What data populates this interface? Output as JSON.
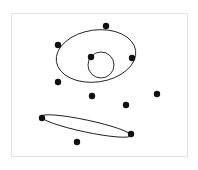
{
  "figure": {
    "title": "",
    "caption": "",
    "background_color": "#ffffff",
    "frame": {
      "name": "figure-border",
      "x": 11,
      "y": 13,
      "width": 177,
      "height": 144,
      "stroke_color": "#e3e3e3",
      "stroke_width": 1
    },
    "stroke_color": "#1a1a1a",
    "point_color": "#111111"
  },
  "chart_data": {
    "type": "scatter",
    "title": "",
    "xlabel": "",
    "ylabel": "",
    "xlim": [
      11,
      188
    ],
    "ylim": [
      13,
      157
    ],
    "grid": false,
    "legend": "none",
    "annotations": [
      "two fitted ellipses over a scattered point set",
      "small circle nested within the upper large ellipse"
    ],
    "ellipses": [
      {
        "name": "large-ellipse",
        "cx": 96,
        "cy": 56,
        "rx": 40,
        "ry": 26,
        "rotation_deg": -8,
        "stroke_color": "#1a1a1a",
        "stroke_width": 0.9
      },
      {
        "name": "small-circle",
        "cx": 101,
        "cy": 65,
        "rx": 13,
        "ry": 13,
        "rotation_deg": 0,
        "stroke_color": "#1a1a1a",
        "stroke_width": 0.9
      },
      {
        "name": "flat-ellipse",
        "cx": 86,
        "cy": 126,
        "rx": 46,
        "ry": 6,
        "rotation_deg": 12,
        "stroke_color": "#1a1a1a",
        "stroke_width": 0.9
      }
    ],
    "points": [
      {
        "label": "p1",
        "x": 106,
        "y": 26,
        "r": 3.2
      },
      {
        "label": "p2",
        "x": 58,
        "y": 45,
        "r": 3.2
      },
      {
        "label": "p3",
        "x": 132,
        "y": 58,
        "r": 3.2
      },
      {
        "label": "p4",
        "x": 91,
        "y": 57,
        "r": 3.2
      },
      {
        "label": "p5",
        "x": 58,
        "y": 82,
        "r": 3.2
      },
      {
        "label": "p6",
        "x": 92,
        "y": 96,
        "r": 3.2
      },
      {
        "label": "p7",
        "x": 126,
        "y": 105,
        "r": 3.2
      },
      {
        "label": "p8",
        "x": 157,
        "y": 94,
        "r": 3.2
      },
      {
        "label": "p9",
        "x": 42,
        "y": 118,
        "r": 3.2
      },
      {
        "label": "p10",
        "x": 131,
        "y": 134,
        "r": 3.2
      },
      {
        "label": "p11",
        "x": 77,
        "y": 142,
        "r": 3.2
      }
    ]
  }
}
